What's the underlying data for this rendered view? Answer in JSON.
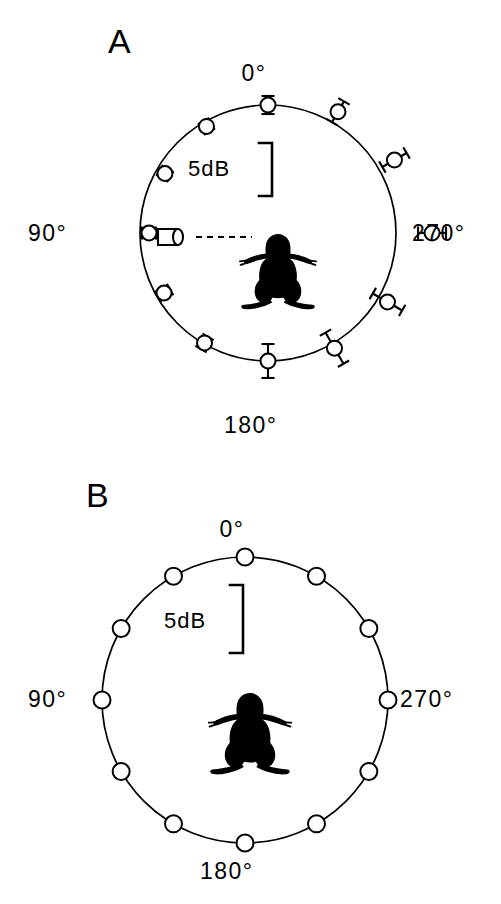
{
  "figure": {
    "panels": [
      {
        "id": "A",
        "letter": "A",
        "letter_pos": {
          "x": 108,
          "y": 24
        },
        "center": {
          "x": 268,
          "y": 233
        },
        "radius": 128,
        "scale_bar": {
          "label": "5dB",
          "label_pos": {
            "x": 188,
            "y": 158
          },
          "bracket_x": 272,
          "bracket_top": 143,
          "bracket_bottom": 196,
          "tick_len": 13,
          "db_per_px": 0.0943
        },
        "axis_labels": [
          {
            "name": "0-degrees",
            "text": "0°",
            "x": 254,
            "y": 62,
            "align": "center"
          },
          {
            "name": "90-degrees",
            "text": "90°",
            "x": 28,
            "y": 222,
            "align": "left"
          },
          {
            "name": "270-degrees",
            "text": "270°",
            "x": 412,
            "y": 222,
            "align": "left"
          },
          {
            "name": "180-degrees",
            "text": "180°",
            "x": 224,
            "y": 414,
            "align": "left"
          }
        ],
        "sound_source": {
          "name": "speaker-icon",
          "x": 176,
          "y": 237,
          "dash_from_x": 196,
          "dash_to_x": 252,
          "dash_y": 237
        },
        "frog": {
          "cx": 278,
          "cy": 270,
          "scale": 1.0
        },
        "data_points": [
          {
            "angle_deg": 0,
            "dev_db": 0.0,
            "err_db": 0.85
          },
          {
            "angle_deg": 30,
            "dev_db": -0.47,
            "err_db": 0.57
          },
          {
            "angle_deg": 60,
            "dev_db": -0.85,
            "err_db": 0.57
          },
          {
            "angle_deg": 90,
            "dev_db": -0.85,
            "err_db": 0.66
          },
          {
            "angle_deg": 120,
            "dev_db": -0.75,
            "err_db": 0.66
          },
          {
            "angle_deg": 150,
            "dev_db": -0.1,
            "err_db": 0.66
          },
          {
            "angle_deg": 180,
            "dev_db": 0.0,
            "err_db": 1.6
          },
          {
            "angle_deg": 210,
            "dev_db": 0.47,
            "err_db": 1.7
          },
          {
            "angle_deg": 240,
            "dev_db": 0.94,
            "err_db": 1.6
          },
          {
            "angle_deg": 270,
            "dev_db": 3.4,
            "err_db": 1.32
          },
          {
            "angle_deg": 300,
            "dev_db": 1.7,
            "err_db": 1.32
          },
          {
            "angle_deg": 330,
            "dev_db": 1.13,
            "err_db": 1.13
          }
        ],
        "marker_radius": 7.5
      },
      {
        "id": "B",
        "letter": "B",
        "letter_pos": {
          "x": 86,
          "y": 18
        },
        "center": {
          "x": 245,
          "y": 240
        },
        "radius": 143,
        "scale_bar": {
          "label": "5dB",
          "label_pos": {
            "x": 164,
            "y": 150
          },
          "bracket_x": 243,
          "bracket_top": 125,
          "bracket_bottom": 193,
          "tick_len": 13,
          "db_per_px": 0.0735
        },
        "axis_labels": [
          {
            "name": "0-degrees",
            "text": "0°",
            "x": 232,
            "y": 58,
            "align": "center"
          },
          {
            "name": "90-degrees",
            "text": "90°",
            "x": 28,
            "y": 228,
            "align": "left"
          },
          {
            "name": "270-degrees",
            "text": "270°",
            "x": 400,
            "y": 228,
            "align": "left"
          },
          {
            "name": "180-degrees",
            "text": "180°",
            "x": 200,
            "y": 400,
            "align": "left"
          }
        ],
        "frog": {
          "cx": 250,
          "cy": 272,
          "scale": 1.08
        },
        "data_points": [
          {
            "angle_deg": 0,
            "dev_db": 0.0,
            "err_db": 0.0
          },
          {
            "angle_deg": 30,
            "dev_db": 0.0,
            "err_db": 0.0
          },
          {
            "angle_deg": 60,
            "dev_db": 0.0,
            "err_db": 0.0
          },
          {
            "angle_deg": 90,
            "dev_db": 0.0,
            "err_db": 0.0
          },
          {
            "angle_deg": 120,
            "dev_db": 0.0,
            "err_db": 0.0
          },
          {
            "angle_deg": 150,
            "dev_db": 0.0,
            "err_db": 0.0
          },
          {
            "angle_deg": 180,
            "dev_db": 0.0,
            "err_db": 0.0
          },
          {
            "angle_deg": 210,
            "dev_db": 0.0,
            "err_db": 0.0
          },
          {
            "angle_deg": 240,
            "dev_db": 0.0,
            "err_db": 0.0
          },
          {
            "angle_deg": 270,
            "dev_db": 0.0,
            "err_db": 0.0
          },
          {
            "angle_deg": 300,
            "dev_db": 0.0,
            "err_db": 0.0
          },
          {
            "angle_deg": 330,
            "dev_db": 0.0,
            "err_db": 0.0
          }
        ],
        "marker_radius": 8.5
      }
    ]
  },
  "chart_data": {
    "type": "line",
    "title": "",
    "subtitle": "",
    "xlabel": "Azimuthal angle (degrees)",
    "ylabel": "Relative sound pressure level (dB)",
    "projection": "polar",
    "grid": false,
    "legend": "none",
    "scale_bar_db": 5,
    "angle_unit": "degrees",
    "angles": [
      0,
      30,
      60,
      90,
      120,
      150,
      180,
      210,
      240,
      270,
      300,
      330
    ],
    "tick_labels": [
      "0°",
      "90°",
      "180°",
      "270°"
    ],
    "series": [
      {
        "name": "A",
        "panel": "A",
        "description": "Directional response with error bars; values are dB deviation from the reference circle",
        "values": [
          0.0,
          -0.47,
          -0.85,
          -0.85,
          -0.75,
          -0.1,
          0.0,
          0.47,
          0.94,
          3.4,
          1.7,
          1.13
        ],
        "errors": [
          0.85,
          0.57,
          0.57,
          0.66,
          0.66,
          0.66,
          1.6,
          1.7,
          1.6,
          1.32,
          1.32,
          1.13
        ],
        "reference_circle_db": 0
      },
      {
        "name": "B",
        "panel": "B",
        "description": "Omnidirectional control; all points lie on the reference circle",
        "values": [
          0,
          0,
          0,
          0,
          0,
          0,
          0,
          0,
          0,
          0,
          0,
          0
        ],
        "errors": [
          0,
          0,
          0,
          0,
          0,
          0,
          0,
          0,
          0,
          0,
          0,
          0
        ],
        "reference_circle_db": 0
      }
    ]
  }
}
